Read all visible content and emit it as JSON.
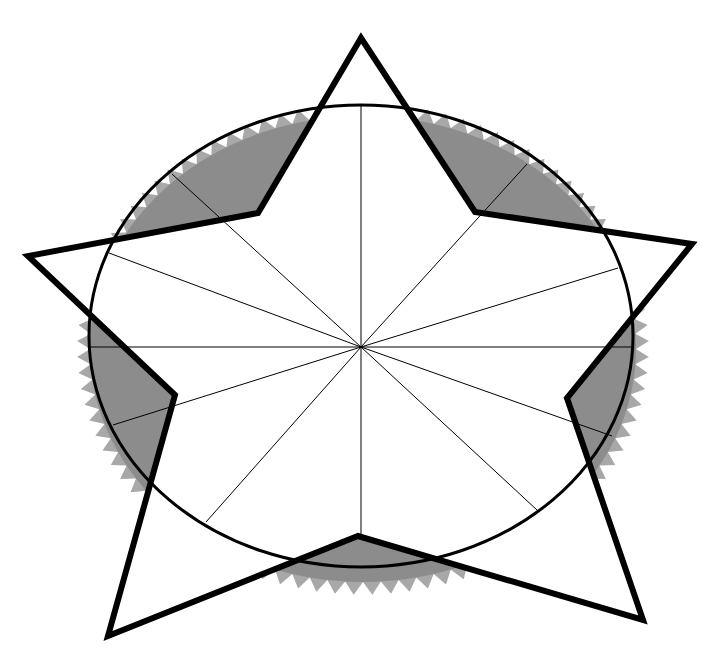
{
  "diagram": {
    "canvas": {
      "width": 721,
      "height": 653,
      "background": "#ffffff"
    },
    "center": [
      361,
      347
    ],
    "ellipse": {
      "cx": 361,
      "cy": 336,
      "rx": 272,
      "ry": 231,
      "stroke": "#000000",
      "stroke_width": 3
    },
    "serrated_ring": {
      "cx": 363,
      "cy": 349,
      "rx": 273,
      "ry": 233,
      "teeth": 96,
      "tooth_depth": 13,
      "fill": "#8c8c8c",
      "tooth_fill": "#a8a8a8"
    },
    "spokes": {
      "stroke": "#000000",
      "stroke_width": 1,
      "endpoints": [
        [
          633,
          347
        ],
        [
          612,
          436
        ],
        [
          537,
          510
        ],
        [
          361,
          536
        ],
        [
          206,
          522
        ],
        [
          113,
          425
        ],
        [
          89,
          347
        ],
        [
          109,
          253
        ],
        [
          172,
          174
        ],
        [
          361,
          106
        ],
        [
          527,
          164
        ],
        [
          618,
          268
        ]
      ]
    },
    "star": {
      "stroke": "#000000",
      "stroke_width": 6,
      "fill": "#ffffff",
      "points": [
        [
          361,
          38
        ],
        [
          475,
          212
        ],
        [
          692,
          244
        ],
        [
          567,
          398
        ],
        [
          643,
          620
        ],
        [
          358,
          536
        ],
        [
          108,
          636
        ],
        [
          175,
          395
        ],
        [
          28,
          256
        ],
        [
          258,
          213
        ]
      ]
    }
  }
}
